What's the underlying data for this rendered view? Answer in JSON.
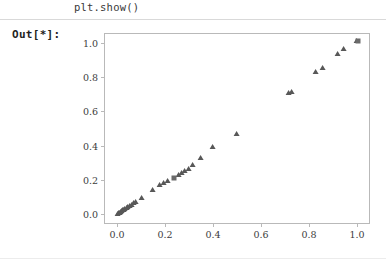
{
  "notebook": {
    "code_line": "plt.show()",
    "out_prompt": "Out[*]:"
  },
  "colors": {
    "marker": "#585858",
    "axes_frame": "#b9b9b9",
    "divider": "#d9d9d9",
    "text": "#3c3c3c",
    "background": "#ffffff"
  },
  "chart_data": {
    "type": "scatter",
    "title": "",
    "xlabel": "",
    "ylabel": "",
    "xlim": [
      -0.05,
      1.05
    ],
    "ylim": [
      -0.05,
      1.05
    ],
    "xticks": [
      0.0,
      0.2,
      0.4,
      0.6,
      0.8,
      1.0
    ],
    "yticks": [
      0.0,
      0.2,
      0.4,
      0.6,
      0.8,
      1.0
    ],
    "xticklabels": [
      "0.0",
      "0.2",
      "0.4",
      "0.6",
      "0.8",
      "1.0"
    ],
    "yticklabels": [
      "0.0",
      "0.2",
      "0.4",
      "0.6",
      "0.8",
      "1.0"
    ],
    "grid": false,
    "legend": null,
    "marker": "triangle-up",
    "marker_color": "#585858",
    "series": [
      {
        "name": "points",
        "marker": "triangle-up",
        "x": [
          0.005,
          0.01,
          0.013,
          0.017,
          0.021,
          0.026,
          0.03,
          0.034,
          0.04,
          0.047,
          0.055,
          0.062,
          0.071,
          0.079,
          0.105,
          0.15,
          0.18,
          0.196,
          0.212,
          0.258,
          0.272,
          0.285,
          0.3,
          0.318,
          0.352,
          0.4,
          0.5,
          0.718,
          0.73,
          0.83,
          0.858,
          0.92,
          0.945,
          1.0
        ],
        "y": [
          0.004,
          0.008,
          0.011,
          0.015,
          0.019,
          0.023,
          0.027,
          0.031,
          0.036,
          0.042,
          0.05,
          0.057,
          0.064,
          0.072,
          0.098,
          0.14,
          0.17,
          0.183,
          0.196,
          0.232,
          0.243,
          0.252,
          0.265,
          0.29,
          0.33,
          0.39,
          0.47,
          0.705,
          0.715,
          0.83,
          0.855,
          0.935,
          0.96,
          1.01
        ]
      },
      {
        "name": "square-point",
        "marker": "square",
        "x": [
          0.238,
          1.005
        ],
        "y": [
          0.212,
          1.01
        ]
      }
    ]
  }
}
